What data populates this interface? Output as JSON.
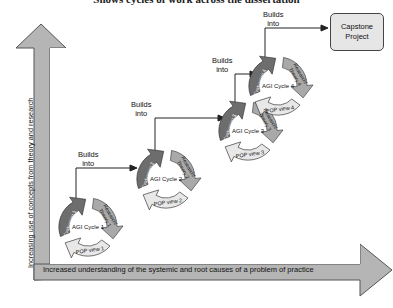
{
  "title": "Shows cycles of work across the dissertation",
  "axes": {
    "vertical_label": "Increasing use of concepts from theory and research",
    "horizontal_label": "Increased understanding of the systemic and root causes of a problem of practice"
  },
  "connector_label": {
    "line1": "Builds",
    "line2": "into"
  },
  "capstone": {
    "line1": "Capstone",
    "line2": "Project"
  },
  "cycles": [
    {
      "center": "AGI Cycle 1",
      "left": "Evaluation 1",
      "right": "Research/ Theory 1",
      "bottom": "POP view 1"
    },
    {
      "center": "AGI Cycle 2",
      "left": "Evaluation 2",
      "right": "Research/ Theory 2",
      "bottom": "POP view 2"
    },
    {
      "center": "AGI Cycle 3",
      "left": "Evaluation 3",
      "right": "Research/ Theory 3",
      "bottom": "POP view 3"
    },
    {
      "center": "AGI Cycle 4",
      "left": "Evaluation 4",
      "right": "Research/ Theory 4",
      "bottom": "POP view 4"
    }
  ],
  "colors": {
    "arrow_fill": "#b5b5b5",
    "arrow_stroke": "#555555",
    "seg_dark": "#6d6d6d",
    "seg_mid": "#a9a9a9",
    "seg_light": "#e8e8e8"
  }
}
